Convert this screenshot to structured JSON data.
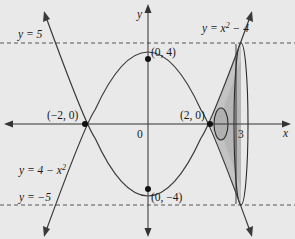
{
  "diagram": {
    "axes": {
      "x_label": "x",
      "y_label": "y",
      "origin_label": "0"
    },
    "curves": [
      {
        "equation": "y = x² − 4",
        "label_prefix": "y = x",
        "label_sup": "2",
        "label_suffix": " − 4"
      },
      {
        "equation": "y = 4 − x²",
        "label_prefix": "y = 4 − x",
        "label_sup": "2"
      }
    ],
    "lines": [
      {
        "label": "y = 5",
        "style": "dashed"
      },
      {
        "label": "y = −5",
        "style": "dashed"
      }
    ],
    "points": [
      {
        "label": "(−2, 0)"
      },
      {
        "label": "(2, 0)"
      },
      {
        "label": "(0, 4)"
      },
      {
        "label": "(0, −4)"
      }
    ],
    "x_tick": "3",
    "colors": {
      "background": "#e9e9e9",
      "curve": "#3a3a3a",
      "shade": "#b5b5b5",
      "shade_light": "#cfcfcf"
    }
  }
}
